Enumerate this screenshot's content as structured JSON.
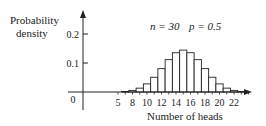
{
  "chart_data": {
    "type": "bar",
    "title": "",
    "annotation": {
      "n_label": "n = 30",
      "p_label": "p = 0.5"
    },
    "ylabel_line1": "Probability",
    "ylabel_line2": "density",
    "xlabel": "Number of heads",
    "yticks": [
      {
        "value": 0.1,
        "label": "0.1"
      },
      {
        "value": 0.2,
        "label": "0.2"
      }
    ],
    "y_origin_label": "0",
    "xticks": [
      {
        "value": 5,
        "label": "5"
      },
      {
        "value": 8,
        "label": "8"
      },
      {
        "value": 10,
        "label": "10"
      },
      {
        "value": 12,
        "label": "12"
      },
      {
        "value": 14,
        "label": "14"
      },
      {
        "value": 16,
        "label": "16"
      },
      {
        "value": 18,
        "label": "18"
      },
      {
        "value": 20,
        "label": "20"
      },
      {
        "value": 22,
        "label": "22"
      }
    ],
    "ylim": [
      0,
      0.22
    ],
    "grid": false,
    "categories": [
      7,
      8,
      9,
      10,
      11,
      12,
      13,
      14,
      15,
      16,
      17,
      18,
      19,
      20,
      21,
      22,
      23
    ],
    "values": [
      0.0019,
      0.0055,
      0.0133,
      0.028,
      0.0509,
      0.0806,
      0.1115,
      0.1354,
      0.1445,
      0.1354,
      0.1115,
      0.0806,
      0.0509,
      0.028,
      0.0133,
      0.0055,
      0.0019
    ]
  },
  "colors": {
    "ink": "#222222",
    "bar_fill": "#ffffff"
  }
}
